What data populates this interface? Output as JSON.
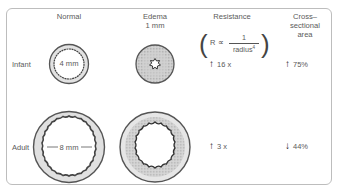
{
  "columns": {
    "normal": "Normal",
    "edema_line1": "Edema",
    "edema_line2": "1 mm",
    "resistance": "Resistance",
    "cross_line1": "Cross–",
    "cross_line2": "sectional",
    "cross_line3": "area"
  },
  "formula": {
    "lhs": "R ∝",
    "numerator": "1",
    "denominator": "radius",
    "exponent": "4"
  },
  "rows": {
    "infant": {
      "label": "Infant",
      "diameter_label": "4 mm",
      "resistance_arrow": "up-arrow",
      "resistance_value": "16 x",
      "area_arrow": "up-arrow",
      "area_value": "75%"
    },
    "adult": {
      "label": "Adult",
      "diameter_label": "8 mm",
      "resistance_arrow": "up-arrow",
      "resistance_value": "3 x",
      "area_arrow": "down-arrow",
      "area_value": "44%"
    }
  },
  "arrows": {
    "up": "↑",
    "down": "↓"
  },
  "colors": {
    "frame_border": "#bdbdbd",
    "ring_stroke": "#555555",
    "mucosa_fill": "#d9d9d9",
    "edema_fill": "#c8c8c8",
    "text": "#5a5a5a"
  }
}
